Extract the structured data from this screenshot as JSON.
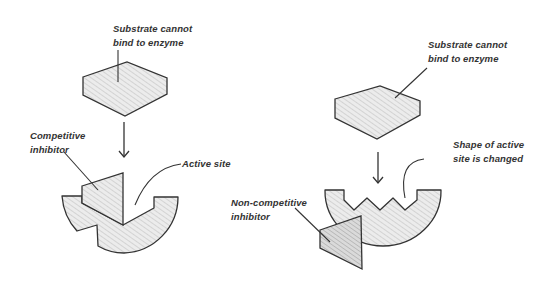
{
  "diagram": {
    "type": "enzyme-inhibition",
    "panels": [
      {
        "id": "competitive",
        "labels": {
          "substrate": [
            "Substrate cannot",
            "bind to enzyme"
          ],
          "inhibitor": [
            "Competitive",
            "inhibitor"
          ],
          "site": [
            "Active site"
          ]
        }
      },
      {
        "id": "non-competitive",
        "labels": {
          "substrate": [
            "Substrate cannot",
            "bind to enzyme"
          ],
          "inhibitor": [
            "Non-competitive",
            "inhibitor"
          ],
          "site": [
            "Shape of active",
            "site is changed"
          ]
        }
      }
    ],
    "colors": {
      "stroke": "#333333",
      "fill": "#e6e6e6",
      "hatch": "#bdbdbd",
      "inhibitor_fill": "#d4d4d4",
      "text": "#333333"
    }
  }
}
